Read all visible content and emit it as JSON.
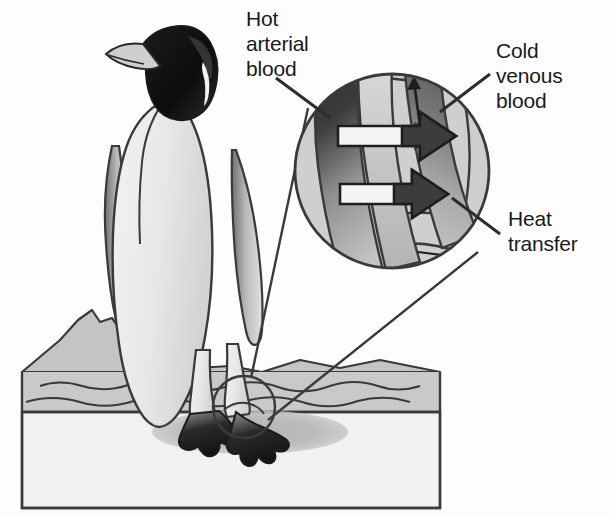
{
  "figure": {
    "background_color": "#fdfdfd",
    "ink_color": "#262626"
  },
  "labels": {
    "hot_arterial": "Hot\narterial\nblood",
    "cold_venous": "Cold\nvenous\nblood",
    "heat_transfer": "Heat\ntransfer"
  },
  "palette": {
    "outline": "#3a3a3a",
    "body_fill": "#e9e9e9",
    "body_shade": "#d2d2d2",
    "head_black": "#111111",
    "ice_block": "#f0f0f0",
    "ice_water": "#c9c9c9",
    "mountain": "#c4c4c4",
    "shadow": "#b6b6b6",
    "magnifier_fill": "#cfcfcf",
    "artery_hot": "#3c3c3c",
    "artery_cool": "#c2c2c2",
    "vein_warm": "#6e6e6e",
    "vein_cold": "#bcbcbc",
    "arrow_fill": "#f4f4f4",
    "arrow_head": "#3c3c3c"
  },
  "magnifier": {
    "center_x": 392,
    "center_y": 171,
    "radius": 98,
    "vessels": [
      {
        "name": "artery",
        "label": "Hot arterial blood",
        "direction": "downward",
        "gradient": "dark-to-light"
      },
      {
        "name": "vein",
        "label": "Cold venous blood",
        "direction": "upward",
        "gradient": "light-to-dark"
      }
    ],
    "heat_arrows": 2,
    "flow_arrows": 2
  },
  "focus_circle": {
    "center_x": 244,
    "center_y": 407,
    "radius": 31,
    "target": "penguin-foot"
  }
}
